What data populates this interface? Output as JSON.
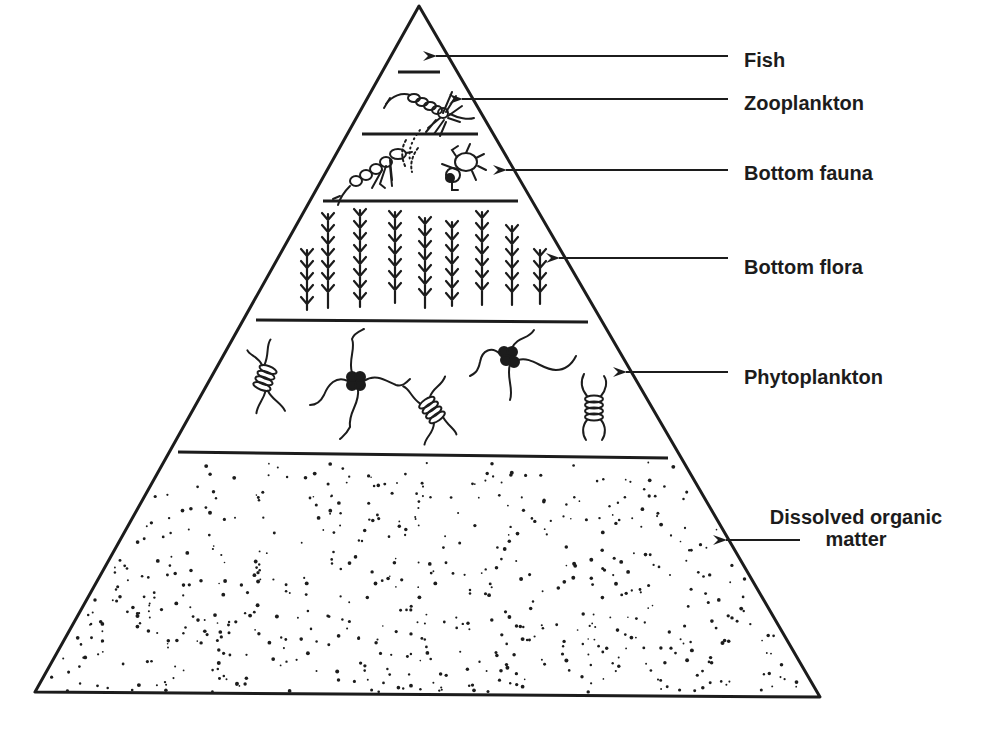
{
  "diagram": {
    "type": "trophic pyramid",
    "levels": [
      {
        "id": "fish",
        "label": "Fish",
        "illustration": "empty apex"
      },
      {
        "id": "zooplankton",
        "label": "Zooplankton",
        "illustration": "copepod"
      },
      {
        "id": "bottom-fauna",
        "label": "Bottom fauna",
        "illustration": "shrimp and beetle"
      },
      {
        "id": "bottom-flora",
        "label": "Bottom flora",
        "illustration": "aquatic plants"
      },
      {
        "id": "phytoplankton",
        "label": "Phytoplankton",
        "illustration": "algae cells"
      },
      {
        "id": "dissolved-organic-matter",
        "label": "Dissolved organic matter",
        "label_lines": [
          "Dissolved organic",
          "matter"
        ],
        "illustration": "stippled dots"
      }
    ],
    "colors": {
      "ink": "#1c1c1c",
      "background": "#ffffff"
    }
  }
}
